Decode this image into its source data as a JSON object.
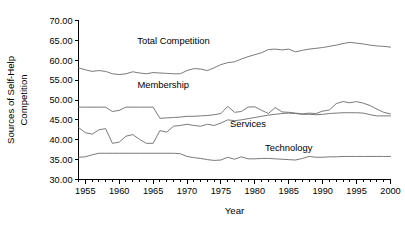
{
  "chart_data": {
    "type": "line",
    "title": "",
    "xlabel": "Year",
    "ylabel": "Sources of Self-Help Competition",
    "ylabel_lines": [
      "Sources of Self-Help",
      "Competition"
    ],
    "xlim": [
      1954,
      2000
    ],
    "ylim": [
      30,
      70
    ],
    "grid": false,
    "legend_position": "inline-labels",
    "y_ticks": [
      30.0,
      35.0,
      40.0,
      45.0,
      50.0,
      55.0,
      60.0,
      65.0,
      70.0
    ],
    "y_tick_labels": [
      "30.00",
      "35.00",
      "40.00",
      "45.00",
      "50.00",
      "55.00",
      "60.00",
      "65.00",
      "70.00"
    ],
    "x_ticks": [
      1955,
      1960,
      1965,
      1970,
      1975,
      1980,
      1985,
      1990,
      1995,
      2000
    ],
    "x_tick_labels": [
      "1955",
      "1960",
      "1965",
      "1970",
      "1975",
      "1980",
      "1985",
      "1990",
      "1995",
      "2000"
    ],
    "x_minor_tick_interval": 1,
    "line_color": "#6b6b6b",
    "x": [
      1954,
      1955,
      1956,
      1957,
      1958,
      1959,
      1960,
      1961,
      1962,
      1963,
      1964,
      1965,
      1966,
      1967,
      1968,
      1969,
      1970,
      1971,
      1972,
      1973,
      1974,
      1975,
      1976,
      1977,
      1978,
      1979,
      1980,
      1981,
      1982,
      1983,
      1984,
      1985,
      1986,
      1987,
      1988,
      1989,
      1990,
      1991,
      1992,
      1993,
      1994,
      1995,
      1996,
      1997,
      1998,
      1999,
      2000
    ],
    "series": [
      {
        "name": "Total Competition",
        "label": "Total Competition",
        "label_x": 1968.0,
        "label_y": 64.1,
        "values": [
          58.1,
          57.6,
          57.2,
          57.4,
          57.2,
          56.6,
          56.4,
          56.6,
          57.1,
          56.8,
          56.6,
          56.9,
          56.8,
          56.7,
          56.6,
          56.6,
          57.4,
          57.9,
          57.8,
          57.4,
          58.1,
          58.9,
          59.4,
          59.6,
          60.3,
          60.9,
          61.4,
          61.9,
          62.7,
          62.8,
          62.6,
          62.8,
          62.1,
          62.5,
          62.8,
          63.0,
          63.2,
          63.5,
          63.8,
          64.2,
          64.5,
          64.3,
          64.1,
          63.8,
          63.6,
          63.5,
          63.3
        ]
      },
      {
        "name": "Membership",
        "label": "Membership",
        "label_x": 1966.5,
        "label_y": 53.1,
        "values": [
          48.2,
          48.2,
          48.2,
          48.2,
          48.2,
          47.1,
          47.4,
          48.2,
          48.2,
          48.2,
          48.2,
          48.2,
          45.4,
          45.5,
          45.6,
          45.7,
          45.9,
          45.9,
          46.0,
          46.1,
          46.3,
          46.6,
          48.4,
          46.9,
          47.1,
          48.2,
          48.3,
          47.4,
          46.6,
          48.1,
          47.0,
          46.9,
          46.7,
          46.5,
          46.7,
          46.6,
          47.2,
          47.5,
          49.1,
          49.6,
          49.3,
          49.6,
          49.2,
          48.6,
          47.7,
          46.9,
          46.5
        ]
      },
      {
        "name": "Services",
        "label": "Services",
        "label_x": 1979.0,
        "label_y": 43.1,
        "values": [
          43.1,
          41.8,
          41.4,
          42.5,
          42.8,
          39.1,
          39.4,
          40.9,
          41.3,
          40.1,
          39.1,
          39.1,
          42.3,
          41.9,
          43.4,
          43.6,
          43.9,
          43.6,
          43.4,
          43.9,
          43.6,
          44.2,
          45.0,
          44.8,
          45.0,
          45.3,
          45.6,
          45.9,
          46.2,
          46.4,
          46.6,
          46.7,
          46.6,
          46.4,
          46.4,
          46.3,
          46.4,
          46.6,
          46.7,
          46.8,
          46.8,
          46.8,
          46.7,
          46.3,
          46.0,
          46.0,
          46.0
        ]
      },
      {
        "name": "Technology",
        "label": "Technology",
        "label_x": 1985.0,
        "label_y": 37.1,
        "values": [
          35.6,
          35.7,
          36.2,
          36.6,
          36.6,
          36.6,
          36.6,
          36.6,
          36.6,
          36.6,
          36.6,
          36.6,
          36.6,
          36.6,
          36.6,
          36.5,
          35.8,
          35.5,
          35.3,
          35.0,
          34.8,
          34.9,
          35.6,
          35.1,
          35.7,
          35.2,
          35.2,
          35.3,
          35.3,
          35.2,
          35.1,
          35.0,
          34.9,
          35.3,
          35.8,
          35.6,
          35.6,
          35.7,
          35.7,
          35.8,
          35.8,
          35.8,
          35.8,
          35.8,
          35.8,
          35.8,
          35.8
        ]
      }
    ]
  }
}
